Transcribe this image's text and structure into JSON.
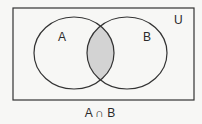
{
  "diagram": {
    "type": "venn",
    "universe_label": "U",
    "sets": [
      {
        "label": "A"
      },
      {
        "label": "B"
      }
    ],
    "shaded_region": "intersection",
    "caption": "A ∩ B",
    "colors": {
      "stroke": "#333333",
      "shade": "#d3d3d3",
      "background": "#f7f7f5"
    }
  }
}
